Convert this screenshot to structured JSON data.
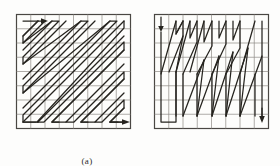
{
  "figure": {
    "type": "diagram",
    "background_color": "#fdfdfc",
    "grid_line_color": "#8e8a85",
    "frame_color": "#4a4743",
    "path_color": "#26241f"
  },
  "panels": [
    {
      "id": "a",
      "caption": "(a)",
      "grid": {
        "rows": 8,
        "cols": 8,
        "cell_size": 14.5,
        "origin_x": 1,
        "origin_y": 1
      },
      "scan_type": "diagonal-zigzag",
      "entry_arrow": {
        "direction": "right",
        "x": 8,
        "y": 8
      },
      "exit_arrow": {
        "direction": "right",
        "x": 117,
        "y": 112
      },
      "path_points": "8,8 30,8 9,29 9,36 8,44 44,8 51,8 9,51 9,58 80,8 87,8 9,80 9,87 116,8 116,15 16,116 51,116 58,116 16,116",
      "polylines": [
        "8,7 28,7 28,7 7,28 7,42 36,13 36,7 42,7 7,42 7,56 57,6 64,6 7,63 7,77 78,6 86,6 7,84 7,98 99,6 106,6 7,105 7,112 116,3",
        "14,113 14,113 35,113 14,113",
        "22,113 43,92"
      ],
      "path_segments_a": [
        [
          "8,7",
          "28,7",
          "7,28",
          "7,34"
        ],
        [
          "7,34",
          "34,7",
          "41,7",
          "7,41",
          "7,48"
        ],
        [
          "7,48",
          "48,7",
          "55,7",
          "7,55",
          "7,62"
        ],
        [
          "7,62",
          "62,7",
          "69,7",
          "7,69",
          "7,76"
        ],
        [
          "7,76",
          "76,7",
          "83,7",
          "7,83",
          "7,90"
        ],
        [
          "7,90",
          "90,7",
          "97,7",
          "7,97",
          "7,104"
        ],
        [
          "7,104",
          "104,7",
          "111,7",
          "7,111",
          "14,111"
        ],
        [
          "14,111",
          "116,9",
          "116,16",
          "21,111",
          "28,111"
        ],
        [
          "28,111",
          "116,23",
          "116,30",
          "35,111",
          "42,111"
        ],
        [
          "42,111",
          "116,37",
          "116,44",
          "49,111",
          "56,111"
        ],
        [
          "56,111",
          "116,51",
          "116,58",
          "63,111",
          "70,111"
        ],
        [
          "70,111",
          "116,65",
          "116,72",
          "77,111",
          "84,111"
        ],
        [
          "84,111",
          "116,79",
          "116,86",
          "91,111",
          "98,111"
        ],
        [
          "98,111",
          "116,93",
          "116,100",
          "105,111",
          "116,111"
        ]
      ],
      "path_segments_b": []
    },
    {
      "id": "b",
      "caption": "(b)",
      "grid": {
        "rows": 8,
        "cols": 8,
        "cell_size": 14.5,
        "origin_x": 1,
        "origin_y": 1
      },
      "scan_type": "vertical-zigzag",
      "entry_arrow": {
        "direction": "down",
        "x": 8,
        "y": 8
      },
      "exit_arrow": {
        "direction": "down",
        "x": 112,
        "y": 112
      },
      "path_segments_b": [
        [
          "7,6",
          "7,62",
          "36,6",
          "36,20",
          "21,6",
          "21,34",
          "50,6",
          "50,48"
        ],
        [
          "7,62",
          "7,104",
          "7,118",
          "21,118",
          "21,104",
          "21,62",
          "50,48",
          "50,62"
        ],
        [
          "36,20",
          "21,34"
        ],
        [
          "36,62",
          "36,104",
          "65,48",
          "65,62"
        ],
        [
          "50,62",
          "36,104"
        ],
        [
          "65,6",
          "79,6",
          "79,20",
          "65,34",
          "94,6",
          "94,48"
        ],
        [
          "94,48",
          "79,104",
          "79,62"
        ],
        [
          "65,62",
          "65,104",
          "94,62",
          "94,104"
        ],
        [
          "108,6",
          "108,20",
          "108,34",
          "108,62",
          "108,104",
          "112,111"
        ]
      ]
    }
  ],
  "captions": {
    "panel_a_label": "(a)",
    "panel_b_label": "(b)"
  }
}
